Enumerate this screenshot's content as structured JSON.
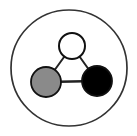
{
  "figure": {
    "title": "Three-node triangular graph inside a circular boundary",
    "caption": "",
    "width": 137,
    "height": 136,
    "background_color": "#ffffff"
  },
  "colors": {
    "outline": "#1a1a1a",
    "node_stroke": "#111111",
    "node_white_fill": "#ffffff",
    "node_gray_fill": "#8a8a8a",
    "node_black_fill": "#000000",
    "edge_stroke": "#222222",
    "boundary_stroke": "#333333"
  },
  "boundary": {
    "name": "outer-circle",
    "shape": "circle",
    "cx": 69,
    "cy": 68,
    "r": 58,
    "stroke_width": 1.7,
    "fill": "none"
  },
  "graph": {
    "node_count": 3,
    "edge_count": 3,
    "nodes": [
      {
        "id": "top",
        "label": "",
        "fill_name": "white",
        "cx": 72,
        "cy": 46,
        "r": 13,
        "stroke_width": 2.0
      },
      {
        "id": "bottom-left",
        "label": "",
        "fill_name": "gray",
        "cx": 46,
        "cy": 82,
        "r": 15,
        "stroke_width": 1.8
      },
      {
        "id": "bottom-right",
        "label": "",
        "fill_name": "black",
        "cx": 97,
        "cy": 81,
        "r": 15,
        "stroke_width": 1.8
      }
    ],
    "edges": [
      {
        "id": "edge-top-left",
        "from": "top",
        "to": "bottom-left",
        "stroke_width": 2.0
      },
      {
        "id": "edge-top-right",
        "from": "top",
        "to": "bottom-right",
        "stroke_width": 2.0
      },
      {
        "id": "edge-left-right",
        "from": "bottom-left",
        "to": "bottom-right",
        "stroke_width": 2.4
      }
    ]
  }
}
